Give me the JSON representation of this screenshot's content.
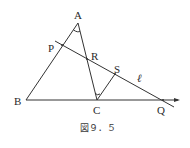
{
  "figure": {
    "caption": "図９．５",
    "points": {
      "A": {
        "label": "A",
        "x": 78,
        "y": 23
      },
      "B": {
        "label": "B",
        "x": 26,
        "y": 100
      },
      "C": {
        "label": "C",
        "x": 97,
        "y": 100
      },
      "P": {
        "label": "P",
        "x": 62,
        "y": 45
      },
      "R": {
        "label": "R",
        "x": 87,
        "y": 59
      },
      "S": {
        "label": "S",
        "x": 115,
        "y": 74
      },
      "Q": {
        "label": "Q",
        "x": 163,
        "y": 100
      }
    },
    "line_label": "ℓ",
    "segments": [
      "AB",
      "AC",
      "BQ (extended ray)",
      "CS",
      "line ℓ through P, R, S, Q"
    ],
    "angle_marks": [
      "angle at A (BAC)",
      "angle at C (RCS)"
    ]
  }
}
